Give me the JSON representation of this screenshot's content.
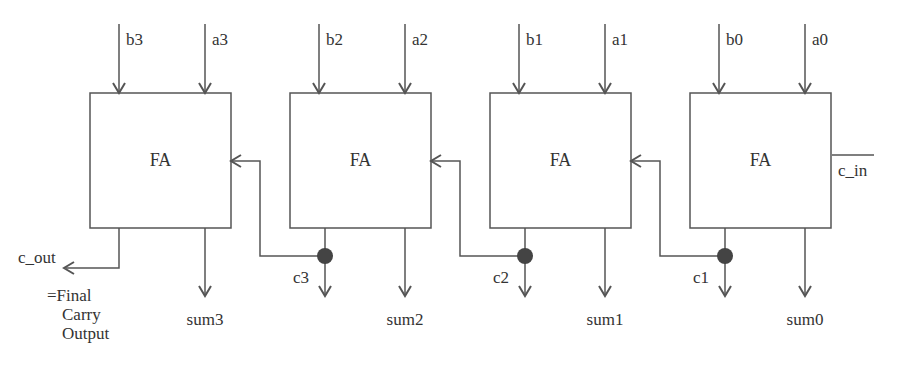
{
  "diagram": {
    "block_label": "FA",
    "blocks": [
      {
        "id": "fa3",
        "x": 90,
        "b": "b3",
        "a": "a3",
        "sum": "sum3"
      },
      {
        "id": "fa2",
        "x": 290,
        "b": "b2",
        "a": "a2",
        "sum": "sum2",
        "carry_out": "c3"
      },
      {
        "id": "fa1",
        "x": 490,
        "b": "b1",
        "a": "a1",
        "sum": "sum1",
        "carry_out": "c2"
      },
      {
        "id": "fa0",
        "x": 690,
        "b": "b0",
        "a": "a0",
        "sum": "sum0",
        "carry_out": "c1"
      }
    ],
    "carry_in_label": "c_in",
    "carry_out_label": "c_out",
    "carry_out_note": [
      "=Final",
      "Carry",
      "Output"
    ],
    "colors": {
      "line": "#555555",
      "dot": "#444444",
      "text": "#333333"
    }
  }
}
